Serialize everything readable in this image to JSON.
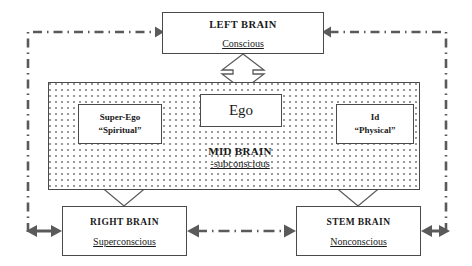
{
  "diagram": {
    "colors": {
      "box_border": "#4a4a4a",
      "arrow_fill": "#ffffff",
      "arrow_stroke": "#4a4a4a",
      "connector": "#5a5a5a",
      "dot_pattern": "#9a9a9a",
      "text": "#1a1a1a"
    }
  },
  "nodes": {
    "left_brain": {
      "title": "LEFT BRAIN",
      "subtitle": "Conscious"
    },
    "right_brain": {
      "title": "RIGHT BRAIN",
      "subtitle": "Superconscious"
    },
    "stem_brain": {
      "title": "STEM BRAIN",
      "subtitle": "Nonconscious"
    },
    "mid_brain": {
      "title": "MID BRAIN",
      "subtitle": "-subconscious"
    },
    "ego": {
      "label": "Ego"
    },
    "super_ego": {
      "line1": "Super-Ego",
      "line2": "“Spiritual”"
    },
    "id": {
      "line1": "Id",
      "line2": "“Physical”"
    }
  },
  "connectors": [
    {
      "name": "left-brain-to-mid-brain",
      "style": "block-double-arrow-vertical",
      "from": "left_brain",
      "to": "mid_brain"
    },
    {
      "name": "super-ego-to-ego",
      "style": "line-double-arrow-diagonal",
      "from": "super_ego",
      "to": "ego"
    },
    {
      "name": "ego-to-id",
      "style": "line-double-arrow-diagonal",
      "from": "ego",
      "to": "id"
    },
    {
      "name": "super-ego-to-right-brain",
      "style": "block-double-arrow-vertical",
      "from": "super_ego",
      "to": "right_brain"
    },
    {
      "name": "id-to-stem-brain",
      "style": "block-double-arrow-vertical",
      "from": "id",
      "to": "stem_brain"
    },
    {
      "name": "right-brain-to-stem-brain",
      "style": "dash-dot-double-arrow-horizontal",
      "from": "right_brain",
      "to": "stem_brain"
    },
    {
      "name": "outer-loop-left",
      "style": "dash-dot-arrow",
      "from": "right_brain",
      "to": "left_brain"
    },
    {
      "name": "outer-loop-right",
      "style": "dash-dot-arrow",
      "from": "stem_brain",
      "to": "left_brain"
    }
  ]
}
